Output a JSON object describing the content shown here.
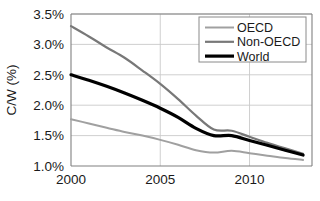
{
  "chart_data": {
    "type": "line",
    "title": "",
    "xlabel": "",
    "ylabel": "C/W (%)",
    "xlim": [
      2000,
      2013.5
    ],
    "ylim": [
      1.0,
      3.5
    ],
    "grid": true,
    "legend_position": "top-right",
    "x_tick_labels": [
      "2000",
      "2005",
      "2010"
    ],
    "x_ticks": [
      2000,
      2005,
      2010
    ],
    "y_tick_labels": [
      "1.0%",
      "1.5%",
      "2.0%",
      "2.5%",
      "3.0%",
      "3.5%"
    ],
    "y_ticks": [
      1.0,
      1.5,
      2.0,
      2.5,
      3.0,
      3.5
    ],
    "x": [
      2000,
      2001,
      2002,
      2003,
      2004,
      2005,
      2006,
      2007,
      2008,
      2009,
      2010,
      2011,
      2012,
      2013
    ],
    "series": [
      {
        "name": "OECD",
        "color": "#a0a0a0",
        "width": 2.0,
        "values": [
          1.77,
          1.7,
          1.63,
          1.56,
          1.5,
          1.43,
          1.35,
          1.26,
          1.22,
          1.25,
          1.21,
          1.17,
          1.13,
          1.1
        ]
      },
      {
        "name": "Non-OECD",
        "color": "#787878",
        "width": 2.2,
        "values": [
          3.3,
          3.13,
          2.95,
          2.78,
          2.57,
          2.35,
          2.1,
          1.83,
          1.6,
          1.58,
          1.48,
          1.38,
          1.29,
          1.2
        ]
      },
      {
        "name": "World",
        "color": "#000000",
        "width": 3.2,
        "values": [
          2.5,
          2.41,
          2.31,
          2.2,
          2.08,
          1.95,
          1.8,
          1.62,
          1.5,
          1.5,
          1.42,
          1.34,
          1.26,
          1.18
        ]
      }
    ]
  },
  "legend": {
    "entries": [
      {
        "label": "OECD"
      },
      {
        "label": "Non-OECD"
      },
      {
        "label": "World"
      }
    ]
  },
  "axes": {
    "y_title": "C/W (%)"
  }
}
